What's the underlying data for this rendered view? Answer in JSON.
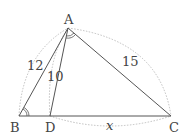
{
  "diagram": {
    "points": {
      "A": {
        "label": "A",
        "x": 68,
        "y": 28
      },
      "B": {
        "label": "B",
        "x": 19,
        "y": 116
      },
      "D": {
        "label": "D",
        "x": 50,
        "y": 116
      },
      "C": {
        "label": "C",
        "x": 171,
        "y": 116
      }
    },
    "segment_labels": {
      "AB": "12",
      "AD": "10",
      "AC": "15",
      "DC": "x"
    },
    "colors": {
      "line": "#555555",
      "dotted": "#aaaaaa",
      "text": "#444444"
    }
  }
}
